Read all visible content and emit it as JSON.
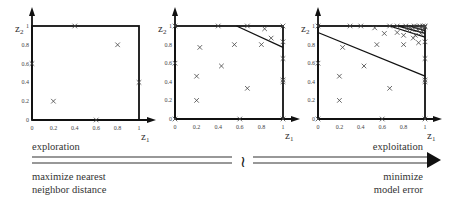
{
  "figure": {
    "panels": [
      {
        "id": "panel-1",
        "xlabel": "z",
        "xlabel_sub": "1",
        "ylabel": "z",
        "ylabel_sub": "2",
        "x_ticks": [
          "0",
          "0.2",
          "0.4",
          "0.6",
          "0.8",
          "1"
        ],
        "y_ticks": [
          "0",
          "0.2",
          "0.4",
          "0.6",
          "0.8",
          "1"
        ],
        "points": [
          [
            0.4,
            1.0
          ],
          [
            0.8,
            0.8
          ],
          [
            0.0,
            0.6
          ],
          [
            1.0,
            0.4
          ],
          [
            0.2,
            0.2
          ],
          [
            0.6,
            0.0
          ]
        ],
        "lines": []
      },
      {
        "id": "panel-2",
        "xlabel": "z",
        "xlabel_sub": "1",
        "ylabel": "z",
        "ylabel_sub": "2",
        "x_ticks": [
          "0",
          "0.2",
          "0.4",
          "0.6",
          "0.8",
          "1"
        ],
        "y_ticks": [
          "0",
          "0.2",
          "0.4",
          "0.6",
          "0.8",
          "1"
        ],
        "points": [
          [
            0.4,
            1.0
          ],
          [
            0.8,
            0.8
          ],
          [
            0.0,
            0.6
          ],
          [
            1.0,
            0.4
          ],
          [
            0.2,
            0.2
          ],
          [
            0.6,
            0.0
          ],
          [
            0.0,
            1.0
          ],
          [
            0.0,
            0.0
          ],
          [
            1.0,
            0.0
          ],
          [
            1.0,
            1.0
          ],
          [
            0.23,
            0.77
          ],
          [
            0.55,
            0.8
          ],
          [
            0.43,
            0.57
          ],
          [
            0.2,
            0.46
          ],
          [
            0.67,
            0.33
          ],
          [
            0.67,
            1.0
          ],
          [
            0.83,
            0.97
          ],
          [
            0.89,
            0.87
          ],
          [
            1.0,
            0.83
          ],
          [
            1.0,
            0.65
          ],
          [
            1.0,
            0.42
          ]
        ],
        "lines": [
          [
            [
              0.57,
              1.0
            ],
            [
              1.0,
              0.77
            ]
          ]
        ]
      },
      {
        "id": "panel-3",
        "xlabel": "z",
        "xlabel_sub": "1",
        "ylabel": "z",
        "ylabel_sub": "2",
        "x_ticks": [
          "0",
          "0.2",
          "0.4",
          "0.6",
          "0.8",
          "1"
        ],
        "y_ticks": [
          "0",
          "0.2",
          "0.4",
          "0.6",
          "0.8",
          "1"
        ],
        "points": [
          [
            0.4,
            1.0
          ],
          [
            0.8,
            0.8
          ],
          [
            0.0,
            0.6
          ],
          [
            1.0,
            0.4
          ],
          [
            0.2,
            0.2
          ],
          [
            0.6,
            0.0
          ],
          [
            0.0,
            1.0
          ],
          [
            0.0,
            0.0
          ],
          [
            1.0,
            0.0
          ],
          [
            1.0,
            1.0
          ],
          [
            0.23,
            0.77
          ],
          [
            0.55,
            0.8
          ],
          [
            0.43,
            0.57
          ],
          [
            0.2,
            0.46
          ],
          [
            0.67,
            0.33
          ],
          [
            0.67,
            1.0
          ],
          [
            0.83,
            0.97
          ],
          [
            0.89,
            0.87
          ],
          [
            1.0,
            0.83
          ],
          [
            1.0,
            0.65
          ],
          [
            1.0,
            0.42
          ],
          [
            0.3,
            1.0
          ],
          [
            0.53,
            0.98
          ],
          [
            0.62,
            0.92
          ],
          [
            0.74,
            1.0
          ],
          [
            0.74,
            0.93
          ],
          [
            0.8,
            0.9
          ],
          [
            0.82,
            1.0
          ],
          [
            0.86,
            0.99
          ],
          [
            0.88,
            0.96
          ],
          [
            0.9,
            1.0
          ],
          [
            0.92,
            0.99
          ],
          [
            0.93,
            0.96
          ],
          [
            0.94,
            0.82
          ],
          [
            0.95,
            1.0
          ],
          [
            0.96,
            0.98
          ],
          [
            0.97,
            0.95
          ],
          [
            0.98,
            1.0
          ],
          [
            0.99,
            0.97
          ],
          [
            1.0,
            0.99
          ],
          [
            0.96,
            0.92
          ],
          [
            0.91,
            0.9
          ]
        ],
        "lines": [
          [
            [
              0.0,
              0.93
            ],
            [
              1.0,
              0.46
            ]
          ],
          [
            [
              0.67,
              1.0
            ],
            [
              1.0,
              0.88
            ]
          ],
          [
            [
              0.75,
              1.0
            ],
            [
              1.0,
              0.92
            ]
          ],
          [
            [
              0.85,
              1.0
            ],
            [
              1.0,
              0.95
            ]
          ]
        ]
      }
    ]
  },
  "spectrum": {
    "left_title": "exploration",
    "left_desc_line1": "maximize nearest",
    "left_desc_line2": "neighbor distance",
    "right_title": "exploitation",
    "right_desc_line1": "minimize",
    "right_desc_line2": "model error",
    "break_symbol": "≀"
  }
}
